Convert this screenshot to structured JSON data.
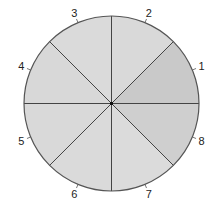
{
  "diagram": {
    "type": "segmented-circle",
    "center": [
      111.5,
      103.5
    ],
    "radius": 87.5,
    "segment_count": 8,
    "outline_color": "#555555",
    "divider_color": "#444444",
    "center_dot_color": "#111111",
    "segments": [
      {
        "label": "1",
        "start_deg": 0,
        "end_deg": 45,
        "fill": "#c9c9c9"
      },
      {
        "label": "2",
        "start_deg": 45,
        "end_deg": 90,
        "fill": "#d9d9d9"
      },
      {
        "label": "3",
        "start_deg": 90,
        "end_deg": 135,
        "fill": "#dadada"
      },
      {
        "label": "4",
        "start_deg": 135,
        "end_deg": 180,
        "fill": "#d8d8d8"
      },
      {
        "label": "5",
        "start_deg": 180,
        "end_deg": 225,
        "fill": "#d9d9d9"
      },
      {
        "label": "6",
        "start_deg": 225,
        "end_deg": 270,
        "fill": "#dadada"
      },
      {
        "label": "7",
        "start_deg": 270,
        "end_deg": 315,
        "fill": "#dbdbdb"
      },
      {
        "label": "8",
        "start_deg": 315,
        "end_deg": 360,
        "fill": "#cfcfcf"
      }
    ]
  }
}
